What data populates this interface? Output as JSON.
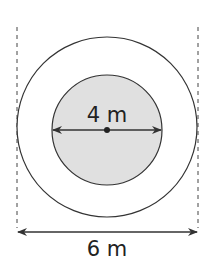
{
  "diagram": {
    "inner_label": "4 m",
    "outer_label": "6 m",
    "colors": {
      "stroke": "#333333",
      "inner_fill": "#e0e0e0",
      "outer_fill": "#ffffff",
      "background": "#ffffff"
    },
    "inner_diameter": "4 m",
    "outer_diameter": "6 m"
  }
}
